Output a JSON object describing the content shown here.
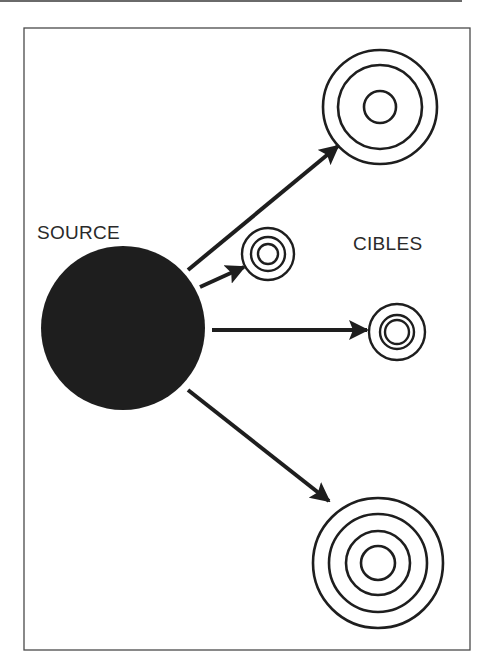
{
  "diagram": {
    "type": "source-to-targets",
    "labels": {
      "source": "SOURCE",
      "targets": "CIBLES"
    },
    "colors": {
      "ink": "#1e1e1e",
      "frame": "#4a4a4a",
      "background": "#ffffff"
    },
    "source": {
      "shape": "filled-circle",
      "cx": 123,
      "cy": 328,
      "r": 82
    },
    "targets": [
      {
        "id": "target-top",
        "cx": 380,
        "cy": 107,
        "rings": [
          57,
          42,
          16
        ]
      },
      {
        "id": "target-small",
        "cx": 268,
        "cy": 254,
        "rings": [
          26,
          17,
          10
        ]
      },
      {
        "id": "target-middle",
        "cx": 397,
        "cy": 332,
        "rings": [
          28,
          17,
          12
        ]
      },
      {
        "id": "target-bottom",
        "cx": 378,
        "cy": 563,
        "rings": [
          65,
          49,
          32,
          17
        ]
      }
    ],
    "arrows": [
      {
        "from": "source",
        "to": "target-top"
      },
      {
        "from": "source",
        "to": "target-small"
      },
      {
        "from": "source",
        "to": "target-middle"
      },
      {
        "from": "source",
        "to": "target-bottom"
      }
    ]
  }
}
